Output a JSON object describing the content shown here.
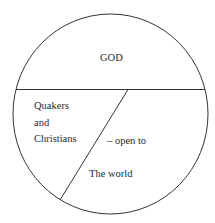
{
  "diagram": {
    "type": "circle-divided-regions",
    "regions": {
      "top": {
        "label": "GOD"
      },
      "left": {
        "lines": [
          "Quakers",
          "and",
          "Christians"
        ]
      },
      "right": {
        "label_1": "– open to",
        "label_2": "The world"
      }
    },
    "stroke_color": "#333333",
    "background_color": "#ffffff"
  }
}
